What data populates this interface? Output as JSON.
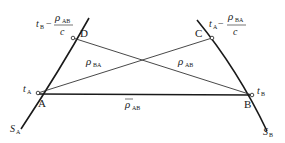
{
  "diagram": {
    "type": "two-way time transfer geometry",
    "curves": [
      {
        "id": "S_A",
        "label_main": "S",
        "label_sub": "A"
      },
      {
        "id": "S_B",
        "label_main": "S",
        "label_sub": "B"
      }
    ],
    "points": {
      "A": {
        "label": "A",
        "time_main": "t",
        "time_sub": "A"
      },
      "B": {
        "label": "B",
        "time_main": "t",
        "time_sub": "B"
      },
      "C": {
        "label": "C",
        "expr": {
          "t_main": "t",
          "t_sub": "A",
          "minus": "−",
          "num_main": "ρ",
          "num_sub": "BA",
          "den": "c"
        }
      },
      "D": {
        "label": "D",
        "expr": {
          "t_main": "t",
          "t_sub": "B",
          "minus": "−",
          "num_main": "ρ",
          "num_sub": "AB",
          "den": "c"
        }
      }
    },
    "segments": [
      {
        "from": "D",
        "to": "B",
        "label_main": "ρ",
        "label_sub": "AB"
      },
      {
        "from": "A",
        "to": "C",
        "label_main": "ρ",
        "label_sub": "BA"
      },
      {
        "from": "A",
        "to": "B",
        "label_main": "ρ",
        "label_sub": "AB",
        "overline": true
      }
    ],
    "colors": {
      "line": "#1a1a1a",
      "thin_line": "#333333",
      "background": "#ffffff"
    }
  }
}
